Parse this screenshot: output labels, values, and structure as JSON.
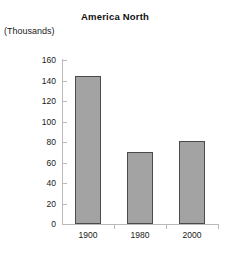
{
  "chart_data": {
    "type": "bar",
    "title": "America North",
    "ylabel": "(Thousands)",
    "xlabel": "",
    "categories": [
      "1900",
      "1980",
      "2000"
    ],
    "values": [
      144,
      70,
      81
    ],
    "ylim": [
      0,
      160
    ],
    "ytick_labels": [
      "160",
      "140",
      "120",
      "100",
      "80",
      "60",
      "40",
      "20",
      "0"
    ],
    "ytick_values": [
      160,
      140,
      120,
      100,
      80,
      60,
      40,
      20,
      0
    ],
    "grid": false,
    "legend": "none",
    "bar_color": "#a3a3a3",
    "bar_border_color": "#4a4a4a",
    "axis_color": "#b9b9b9",
    "text_color": "#1a1a1a",
    "background": "#ffffff"
  }
}
